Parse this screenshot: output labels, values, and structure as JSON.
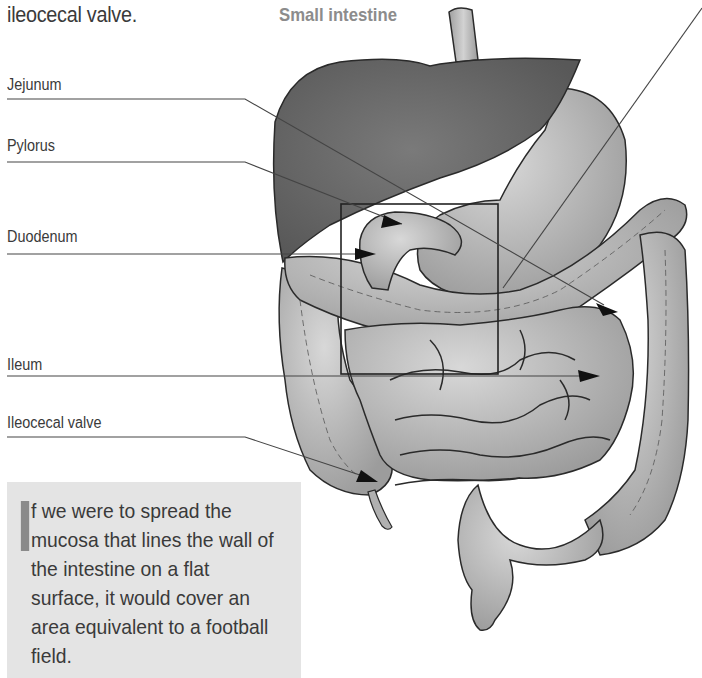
{
  "header": {
    "continued_text": "ileocecal valve.",
    "title": "Small intestine"
  },
  "labels": [
    {
      "text": "Jejunum",
      "top": 76
    },
    {
      "text": "Pylorus",
      "top": 137
    },
    {
      "text": "Duodenum",
      "top": 228
    },
    {
      "text": "Ileum",
      "top": 356
    },
    {
      "text": "Ileocecal valve",
      "top": 414
    }
  ],
  "fact_box": {
    "dropcap_letter": "I",
    "text": "f we were to spread the mucosa that lines the wall of the intestine on a flat surface, it would cover an area equivalent to a football field."
  },
  "figure": {
    "structures": [
      "liver",
      "esophagus",
      "stomach",
      "pylorus",
      "duodenum",
      "jejunum",
      "ileum",
      "ileocecal valve",
      "cecum",
      "appendix",
      "ascending colon",
      "transverse colon",
      "descending colon",
      "sigmoid colon",
      "rectum"
    ],
    "colors": {
      "liver": "#6e6e6e",
      "organ_fill": "#b8b8b8",
      "outline": "#2a2a2a",
      "leader_line": "#444444",
      "fact_box_bg": "#e4e4e4",
      "title_color": "#8c8c8c"
    }
  }
}
